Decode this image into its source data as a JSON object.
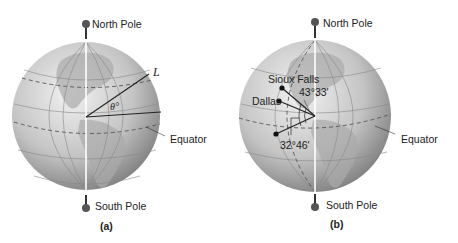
{
  "figure_a": {
    "caption": "(a)",
    "north_pole_label": "North Pole",
    "south_pole_label": "South Pole",
    "equator_label": "Equator",
    "point_label": "L",
    "angle_label": "θ°"
  },
  "figure_b": {
    "caption": "(b)",
    "north_pole_label": "North Pole",
    "south_pole_label": "South Pole",
    "equator_label": "Equator",
    "city1_label": "Sioux Falls",
    "city2_label": "Dallas",
    "angle1_label": "43°33′",
    "angle2_label": "32°46′"
  },
  "colors": {
    "globe_light": "#eeeeee",
    "globe_dark": "#8a8a8a",
    "land": "#a9a9a9",
    "axis": "#ffffff",
    "line": "#222222"
  }
}
